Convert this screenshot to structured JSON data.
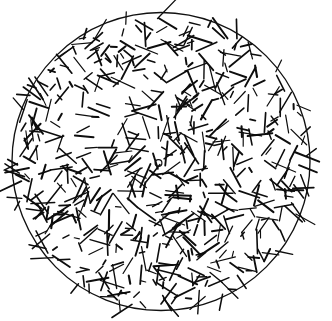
{
  "figure": {
    "kind": "scatter",
    "background_color": "#ffffff",
    "ink_color": "#0d0d0d",
    "canvas": {
      "width": 332,
      "height": 321
    },
    "boundary": {
      "name": "disk-boundary",
      "shape": "circle",
      "cx": 161,
      "cy": 161.5,
      "r": 149,
      "stroke_color": "#111111",
      "stroke_width": 1.35
    },
    "center_marker": {
      "name": "center-point-marker",
      "shape": "open-circle",
      "cx": 158.5,
      "cy": 163,
      "r": 3.4,
      "stroke_color": "#111111",
      "stroke_width": 1.2
    },
    "needles": {
      "count": 560,
      "length_min": 5,
      "length_max": 26,
      "stroke_width_min": 1.1,
      "stroke_width_max": 2.1,
      "orientation": "uniform-random",
      "distribution": "uniform in disk",
      "outside_crossing_count": 26
    },
    "chart_data": {
      "type": "scatter",
      "title": "Random needles in a disk",
      "xlabel": "",
      "ylabel": "",
      "xlim": [
        12,
        310
      ],
      "ylim": [
        12,
        311
      ],
      "grid": false,
      "legend": "none",
      "annotations": [
        "open circle marker near disk center"
      ],
      "series": [
        {
          "name": "needles",
          "count": 560,
          "marker": "line-segment"
        },
        {
          "name": "center-marker",
          "count": 1,
          "marker": "open-circle",
          "x": [
            158.5
          ],
          "y": [
            163
          ]
        }
      ]
    }
  }
}
